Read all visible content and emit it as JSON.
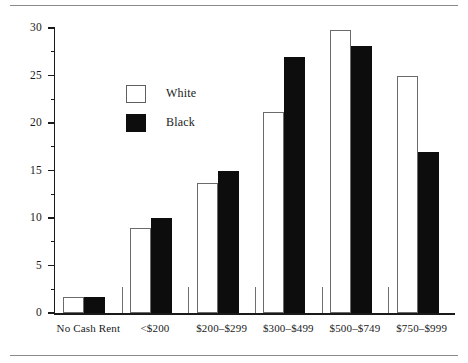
{
  "chart_data": {
    "type": "bar",
    "title": "",
    "subtitle": "",
    "xlabel": "",
    "ylabel": "Percentage",
    "ylim": [
      0,
      30
    ],
    "ytick_step": 5,
    "yminor_step": 2.5,
    "grid": false,
    "legend_position": "upper-left-inside",
    "categories": [
      "No Cash Rent",
      "<$200",
      "$200–$299",
      "$300–$499",
      "$500–$749",
      "$750–$999"
    ],
    "ytick_labels": [
      "0",
      "5",
      "10",
      "15",
      "20",
      "25",
      "30"
    ],
    "ytick_values": [
      0,
      5,
      10,
      15,
      20,
      25,
      30
    ],
    "series": [
      {
        "name": "White",
        "color": "#ffffff",
        "edge_color": "#6b6b6b",
        "values": [
          1.7,
          8.9,
          13.7,
          21.2,
          29.8,
          25.0
        ]
      },
      {
        "name": "Black",
        "color": "#0d0d0d",
        "edge_color": "#0d0d0d",
        "values": [
          1.7,
          10.0,
          15.0,
          27.0,
          28.1,
          17.0
        ]
      }
    ]
  },
  "legend": {
    "items": [
      {
        "label": "White",
        "swatch": "open-square"
      },
      {
        "label": "Black",
        "swatch": "filled-square"
      }
    ]
  },
  "rules": {
    "top": "horizontal-rule-top",
    "bottom": "horizontal-rule-bottom"
  }
}
